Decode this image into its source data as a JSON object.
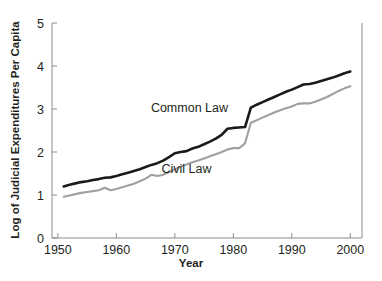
{
  "chart_data": {
    "type": "line",
    "title": "",
    "xlabel": "Year",
    "ylabel": "Log of Judicial Expenditures Per Capita",
    "xlim": [
      1949,
      2002
    ],
    "ylim": [
      0,
      5
    ],
    "grid": false,
    "legend_position": "inline-annotations",
    "x_ticks": [
      "1950",
      "1960",
      "1970",
      "1980",
      "1990",
      "2000"
    ],
    "x_tick_values": [
      1950,
      1960,
      1970,
      1980,
      1990,
      2000
    ],
    "y_ticks": [
      "0",
      "1",
      "2",
      "3",
      "4",
      "5"
    ],
    "y_tick_values": [
      0,
      1,
      2,
      3,
      4,
      5
    ],
    "x": [
      1951,
      1952,
      1953,
      1954,
      1955,
      1956,
      1957,
      1958,
      1959,
      1960,
      1961,
      1962,
      1963,
      1964,
      1965,
      1966,
      1967,
      1968,
      1969,
      1970,
      1971,
      1972,
      1973,
      1974,
      1975,
      1976,
      1977,
      1978,
      1979,
      1980,
      1981,
      1982,
      1983,
      1984,
      1985,
      1986,
      1987,
      1988,
      1989,
      1990,
      1991,
      1992,
      1993,
      1994,
      1995,
      1996,
      1997,
      1998,
      1999,
      2000
    ],
    "series": [
      {
        "name": "Common Law",
        "color": "#1a1a1a",
        "label_x": 1972.5,
        "label_y": 2.92,
        "values": [
          1.2,
          1.24,
          1.27,
          1.3,
          1.32,
          1.35,
          1.37,
          1.4,
          1.41,
          1.44,
          1.48,
          1.52,
          1.56,
          1.6,
          1.65,
          1.7,
          1.74,
          1.8,
          1.88,
          1.97,
          2.0,
          2.02,
          2.08,
          2.12,
          2.18,
          2.24,
          2.31,
          2.4,
          2.54,
          2.56,
          2.57,
          2.58,
          3.03,
          3.1,
          3.16,
          3.22,
          3.28,
          3.34,
          3.4,
          3.45,
          3.51,
          3.57,
          3.58,
          3.61,
          3.65,
          3.69,
          3.73,
          3.78,
          3.83,
          3.87
        ]
      },
      {
        "name": "Civil Law",
        "color": "#a0a0a0",
        "label_x": 1972.0,
        "label_y": 1.52,
        "values": [
          0.96,
          0.99,
          1.02,
          1.05,
          1.07,
          1.09,
          1.11,
          1.17,
          1.11,
          1.14,
          1.18,
          1.22,
          1.26,
          1.32,
          1.38,
          1.47,
          1.44,
          1.47,
          1.53,
          1.6,
          1.66,
          1.71,
          1.76,
          1.8,
          1.85,
          1.9,
          1.95,
          2.0,
          2.06,
          2.09,
          2.09,
          2.2,
          2.68,
          2.74,
          2.8,
          2.86,
          2.92,
          2.97,
          3.02,
          3.06,
          3.12,
          3.13,
          3.13,
          3.17,
          3.22,
          3.28,
          3.35,
          3.42,
          3.48,
          3.53
        ]
      }
    ]
  },
  "axes": {
    "x_title": "Year",
    "y_title": "Log of Judicial Expenditures Per Capita"
  },
  "colors": {
    "common_law": "#1a1a1a",
    "civil_law": "#a0a0a0",
    "frame": "#8c8c8c",
    "text": "#231f20",
    "background": "#ffffff"
  }
}
